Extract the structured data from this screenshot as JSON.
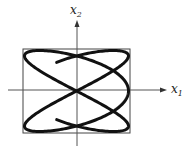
{
  "figure": {
    "axes": {
      "x_label": "x",
      "x_sub": "1",
      "y_label": "x",
      "y_sub": "2",
      "origin": [
        77,
        90
      ],
      "x_axis": {
        "from": 8,
        "to": 167
      },
      "y_axis": {
        "from": 146,
        "to": 20
      }
    },
    "bounding_box": {
      "x": 23,
      "y": 49,
      "width": 107,
      "height": 84
    },
    "curve": {
      "type": "lissajous-open",
      "x_expr": "-cos(3t)",
      "y_expr": "sin(2t)",
      "t_start": 0.393,
      "t_end": 5.89,
      "stroke": "#111111",
      "stroke_width": 3
    },
    "colors": {
      "axis": "#555555",
      "box": "#444444",
      "curve": "#111111"
    }
  }
}
